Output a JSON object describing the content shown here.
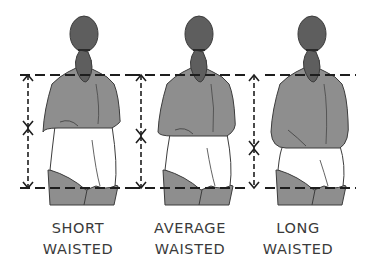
{
  "diagram": {
    "colors": {
      "skin": "#8e8e8e",
      "hair": "#5e5e5e",
      "outline": "#3c3c3c",
      "briefs": "#ffffff",
      "guide_line": "#1e1e1e",
      "label_text": "#3a3a3a"
    },
    "shoulder_line_y": 75,
    "hip_line_y": 188,
    "figures": [
      {
        "id": "short",
        "label_line1": "SHORT",
        "label_line2": "WAISTED",
        "arrow_x": 28,
        "waist_marker_y": 128,
        "body_offset_x": 0,
        "guide_x1": 20,
        "guide_x2": 135,
        "label_center_x": 78
      },
      {
        "id": "average",
        "label_line1": "AVERAGE",
        "label_line2": "WAISTED",
        "arrow_x": 141,
        "waist_marker_y": 136,
        "body_offset_x": 115,
        "guide_x1": 130,
        "guide_x2": 245,
        "label_center_x": 190
      },
      {
        "id": "long",
        "label_line1": "LONG",
        "label_line2": "WAISTED",
        "arrow_x": 254,
        "waist_marker_y": 148,
        "body_offset_x": 228,
        "guide_x1": 265,
        "guide_x2": 356,
        "label_center_x": 298
      }
    ]
  }
}
